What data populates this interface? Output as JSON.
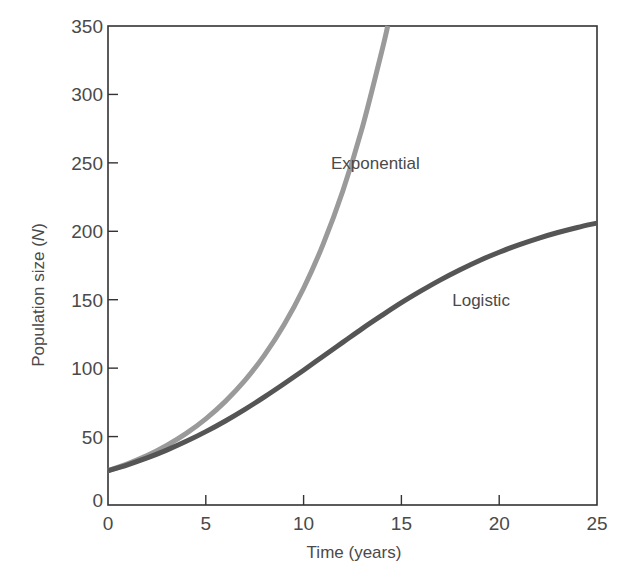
{
  "chart_data": {
    "type": "line",
    "title": "",
    "xlabel": "Time (years)",
    "ylabel_prefix": "Population size (",
    "ylabel_var": "N",
    "ylabel_suffix": ")",
    "xlim": [
      0,
      25
    ],
    "ylim": [
      0,
      350
    ],
    "grid": false,
    "legend": "inline labels",
    "x_ticks": [
      0,
      5,
      10,
      15,
      20,
      25
    ],
    "y_ticks": [
      0,
      50,
      100,
      150,
      200,
      250,
      300,
      350
    ],
    "series": [
      {
        "name": "Exponential",
        "color": "#9a9a9a",
        "label_pos": {
          "x": 11.4,
          "y": 250
        },
        "x": [
          0,
          1,
          2,
          3,
          4,
          5,
          6,
          7,
          8,
          9,
          10,
          11,
          12,
          13,
          14,
          14.3
        ],
        "values": [
          25,
          30.1,
          36.1,
          43.5,
          52.3,
          62.9,
          75.7,
          91.0,
          109.5,
          131.7,
          158.4,
          190.6,
          229.2,
          275.7,
          331.7,
          350
        ]
      },
      {
        "name": "Logistic",
        "color": "#555555",
        "label_pos": {
          "x": 17.6,
          "y": 150
        },
        "x": [
          0,
          1,
          2,
          3,
          4,
          5,
          6,
          7,
          8,
          9,
          10,
          11,
          12,
          13,
          14,
          15,
          16,
          17,
          18,
          19,
          20,
          21,
          22,
          23,
          24,
          25
        ],
        "values": [
          25,
          29.4,
          34.4,
          40.1,
          46.5,
          53.6,
          61.4,
          69.9,
          79.0,
          88.6,
          98.5,
          108.7,
          118.8,
          128.9,
          138.5,
          147.8,
          156.4,
          164.5,
          171.9,
          178.7,
          184.7,
          190.1,
          194.9,
          199.1,
          202.8,
          206.0
        ]
      }
    ]
  }
}
